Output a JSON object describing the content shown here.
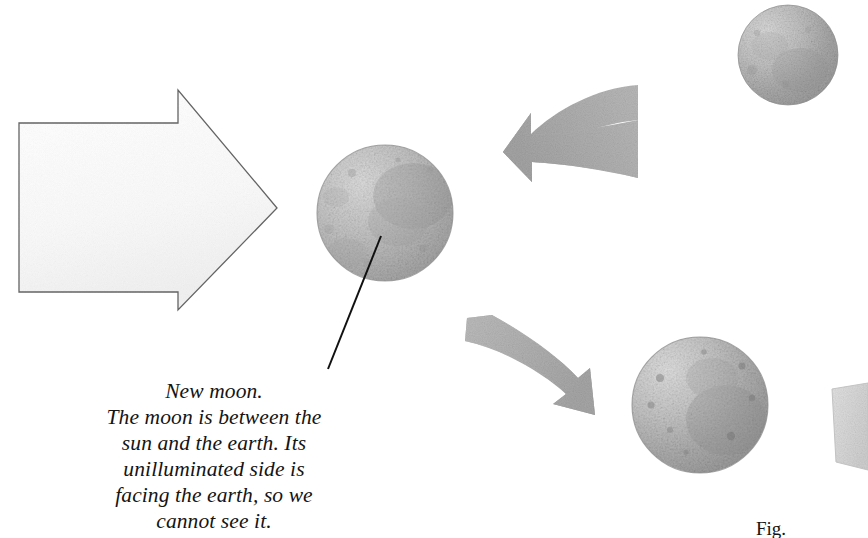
{
  "figure": {
    "background_color": "#ffffff",
    "caption": {
      "lines": [
        "New moon.",
        "The moon is between the",
        "sun and the earth. Its",
        "unilluminated side is",
        "facing the earth, so we",
        "cannot see it."
      ],
      "full_text": "New moon. The moon is between the sun and the earth. Its unilluminated side is facing the earth, so we cannot see it.",
      "text_color": "#141414",
      "style": "italic-serif"
    },
    "fig_label": {
      "text": "Fig.",
      "note": "cropped at bottom edge"
    },
    "moons": [
      {
        "id": "moon-top-right",
        "cx": 788,
        "cy": 55,
        "r": 50,
        "label": "moon upper right",
        "base_color": "#c2c2c2"
      },
      {
        "id": "moon-center",
        "cx": 385,
        "cy": 213,
        "r": 68,
        "label": "new moon center",
        "base_color": "#b8b8b8"
      },
      {
        "id": "moon-bottom-right",
        "cx": 700,
        "cy": 405,
        "r": 68,
        "label": "moon lower right",
        "base_color": "#bdbdbd"
      }
    ],
    "arrows": {
      "sunlight_arrow": {
        "id": "arrow-sunlight",
        "direction": "right",
        "fill": "#fbfbfb",
        "stroke": "#6b6b6b",
        "tip_x": 277,
        "tip_y": 208
      },
      "orbit_arrow_upper": {
        "id": "arrow-orbit-upper",
        "direction": "left",
        "fill": "#b0b0b0",
        "tip_x": 503,
        "tip_y": 152
      },
      "orbit_arrow_lower": {
        "id": "arrow-orbit-lower",
        "direction": "right-down",
        "fill": "#b2b2b2",
        "tip_x": 595,
        "tip_y": 415
      },
      "orbit_arrow_edge": {
        "id": "arrow-orbit-edge",
        "direction": "down",
        "fill": "#dcdcdc",
        "note": "cropped at right edge"
      }
    },
    "leader_line": {
      "id": "leader-line-new-moon",
      "from_x": 381,
      "from_y": 236,
      "to_x": 328,
      "to_y": 369,
      "color": "#111111"
    }
  }
}
